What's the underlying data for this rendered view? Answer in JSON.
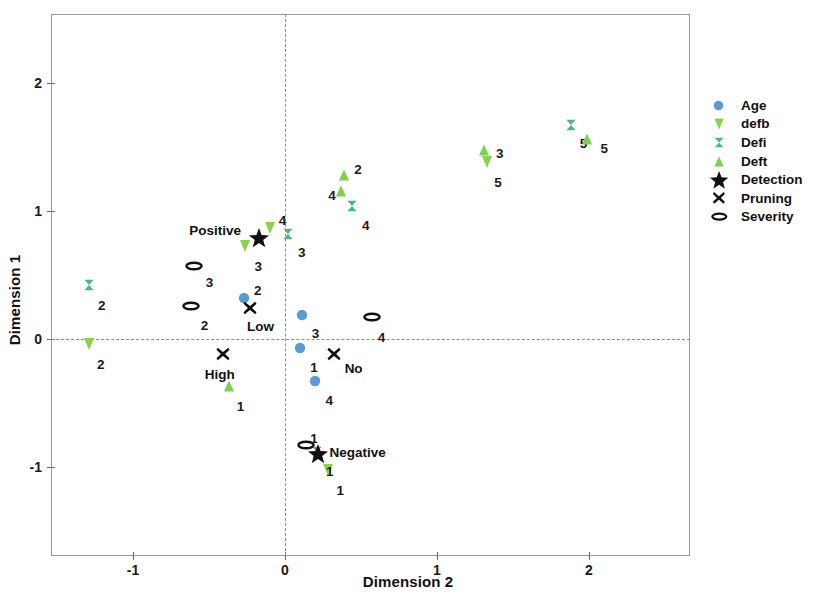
{
  "chart_data": {
    "type": "scatter",
    "title": "",
    "subtitle": "Variable Principal Normalization",
    "xlabel": "Dimension 2",
    "ylabel": "Dimension 1",
    "xlim": [
      -1.55,
      2.6
    ],
    "ylim": [
      -1.55,
      2.45
    ],
    "xticks": [
      -1,
      0,
      1,
      2
    ],
    "xticklabels": [
      "-1",
      "0",
      "1",
      "2"
    ],
    "yticks": [
      -1,
      0,
      1,
      2
    ],
    "yticklabels": [
      "-1",
      "0",
      "1",
      "2"
    ],
    "grid": false,
    "zero_reference_lines": true,
    "legend_position": "right",
    "colors": {
      "age": "#5B9BD5",
      "defb": "#8DD14B",
      "defi": "#4CB87E",
      "deft": "#7BD24A",
      "detection": "#111111",
      "pruning": "#111111",
      "severity": "#111111"
    },
    "series": [
      {
        "name": "Age",
        "marker": "circle",
        "color": "#5B9BD5",
        "points": [
          {
            "x": -0.27,
            "y": 0.32,
            "label": "2",
            "lx": 10,
            "ly": -14
          },
          {
            "x": 0.11,
            "y": 0.19,
            "label": "3",
            "lx": 10,
            "ly": 12
          },
          {
            "x": 0.1,
            "y": -0.07,
            "label": "1",
            "lx": 10,
            "ly": 13
          },
          {
            "x": 0.2,
            "y": -0.33,
            "label": "4",
            "lx": 10,
            "ly": 13
          }
        ]
      },
      {
        "name": "defb",
        "marker": "triangle-down",
        "color": "#8DD14B",
        "points": [
          {
            "x": -1.29,
            "y": -0.04,
            "label": "2",
            "lx": 8,
            "ly": 14
          },
          {
            "x": -0.26,
            "y": 0.73,
            "label": "3",
            "lx": 9,
            "ly": 14
          },
          {
            "x": -0.1,
            "y": 0.87,
            "label": "4",
            "lx": 9,
            "ly": -14
          },
          {
            "x": 1.33,
            "y": 1.38,
            "label": "5",
            "lx": 7,
            "ly": 14
          },
          {
            "x": 0.28,
            "y": -1.02,
            "label": "1",
            "lx": 9,
            "ly": 14
          }
        ]
      },
      {
        "name": "Defi",
        "marker": "hourglass",
        "color": "#4CB87E",
        "points": [
          {
            "x": -1.29,
            "y": 0.42,
            "label": "2",
            "lx": 9,
            "ly": 14
          },
          {
            "x": 0.02,
            "y": 0.82,
            "label": "3",
            "lx": 10,
            "ly": 12
          },
          {
            "x": 0.44,
            "y": 1.04,
            "label": "4",
            "lx": 10,
            "ly": 13
          },
          {
            "x": 1.88,
            "y": 1.67,
            "label": "5",
            "lx": 9,
            "ly": 12
          },
          {
            "x": 0.21,
            "y": -0.88,
            "label": "1",
            "lx": 9,
            "ly": 13
          }
        ]
      },
      {
        "name": "Deft",
        "marker": "triangle-up",
        "color": "#7BD24A",
        "points": [
          {
            "x": -0.37,
            "y": -0.37,
            "label": "1",
            "lx": 8,
            "ly": 14
          },
          {
            "x": 0.39,
            "y": 1.28,
            "label": "2",
            "lx": 10,
            "ly": -12
          },
          {
            "x": 0.37,
            "y": 1.16,
            "label": "4",
            "lx": -13,
            "ly": -2
          },
          {
            "x": 1.31,
            "y": 1.48,
            "label": "3",
            "lx": 12,
            "ly": -3
          },
          {
            "x": 1.99,
            "y": 1.56,
            "label": "5",
            "lx": 13,
            "ly": 3
          }
        ]
      },
      {
        "name": "Detection",
        "marker": "star",
        "color": "#111111",
        "points": [
          {
            "x": -0.17,
            "y": 0.79,
            "name": "Positive",
            "nx": -70,
            "ny": -14
          },
          {
            "x": 0.22,
            "y": -0.9,
            "name": "Negative",
            "nx": 11,
            "ny": -8
          }
        ]
      },
      {
        "name": "Pruning",
        "marker": "cross-x",
        "color": "#111111",
        "points": [
          {
            "x": -0.23,
            "y": 0.24,
            "name": "Low",
            "nx": -3,
            "ny": 12
          },
          {
            "x": -0.41,
            "y": -0.12,
            "name": "High",
            "nx": -18,
            "ny": 14
          },
          {
            "x": 0.32,
            "y": -0.12,
            "name": "No",
            "nx": 11,
            "ny": 8
          }
        ]
      },
      {
        "name": "Severity",
        "marker": "ellipse",
        "color": "#111111",
        "points": [
          {
            "x": -0.6,
            "y": 0.57,
            "label": "3",
            "lx": 12,
            "ly": 10
          },
          {
            "x": -0.62,
            "y": 0.26,
            "label": "2",
            "lx": 10,
            "ly": 13
          },
          {
            "x": 0.57,
            "y": 0.17,
            "label": "4",
            "lx": 6,
            "ly": 14
          },
          {
            "x": 0.14,
            "y": -0.83,
            "label": "1",
            "lx": 4,
            "ly": -13
          }
        ]
      }
    ],
    "legend": [
      {
        "label": "Age",
        "marker": "circle",
        "color": "#5B9BD5"
      },
      {
        "label": "defb",
        "marker": "triangle-down",
        "color": "#8DD14B"
      },
      {
        "label": "Defi",
        "marker": "hourglass",
        "color": "#4CB87E"
      },
      {
        "label": "Deft",
        "marker": "triangle-up",
        "color": "#7BD24A"
      },
      {
        "label": "Detection",
        "marker": "star",
        "color": "#111111"
      },
      {
        "label": "Pruning",
        "marker": "cross-x",
        "color": "#111111"
      },
      {
        "label": "Severity",
        "marker": "ellipse",
        "color": "#111111"
      }
    ]
  }
}
